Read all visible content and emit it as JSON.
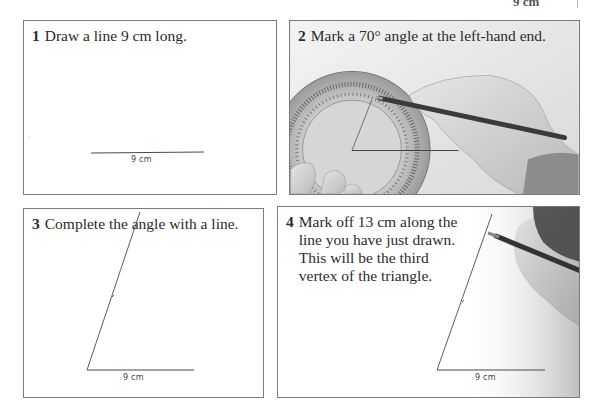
{
  "page_header": {
    "fragment": "9 cm"
  },
  "steps": [
    {
      "number": "1",
      "text": "Draw a line 9 cm long.",
      "figure_label": "9 cm"
    },
    {
      "number": "2",
      "text": "Mark a 70° angle at the left-hand end.",
      "figure": "photo-protractor-hand-pencil"
    },
    {
      "number": "3",
      "text": "Complete the angle with a line.",
      "figure_label": "9 cm"
    },
    {
      "number": "4",
      "text_lines": [
        "Mark off 13 cm along the",
        "line you have just drawn.",
        "This will be the third",
        "vertex of the triangle."
      ],
      "figure_label": "9 cm",
      "figure": "photo-hand-pencil"
    }
  ],
  "colors": {
    "border": "#7a7a7a",
    "line": "#4a4a4a",
    "text": "#2b2b2b"
  }
}
